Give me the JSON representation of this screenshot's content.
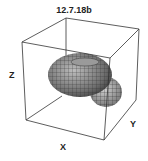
{
  "figure": {
    "title": "12.7.18b",
    "axis_labels": {
      "x": "X",
      "y": "Y",
      "z": "Z"
    }
  }
}
